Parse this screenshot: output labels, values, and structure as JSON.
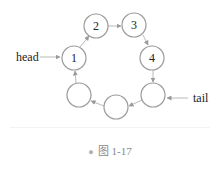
{
  "diagram": {
    "type": "circular-linked-list",
    "nodes": [
      {
        "id": "n1",
        "label": "1",
        "cx": 74,
        "cy": 58
      },
      {
        "id": "n2",
        "label": "2",
        "cx": 96,
        "cy": 26
      },
      {
        "id": "n3",
        "label": "3",
        "cx": 134,
        "cy": 25
      },
      {
        "id": "n4",
        "label": "4",
        "cx": 152,
        "cy": 58
      },
      {
        "id": "n5",
        "label": "",
        "cx": 153,
        "cy": 95
      },
      {
        "id": "n6",
        "label": "",
        "cx": 116,
        "cy": 107
      },
      {
        "id": "n7",
        "label": "",
        "cx": 79,
        "cy": 95
      }
    ],
    "edges": [
      {
        "from": "n1",
        "to": "n2"
      },
      {
        "from": "n2",
        "to": "n3"
      },
      {
        "from": "n3",
        "to": "n4"
      },
      {
        "from": "n4",
        "to": "n5"
      },
      {
        "from": "n5",
        "to": "n6"
      },
      {
        "from": "n6",
        "to": "n7"
      },
      {
        "from": "n7",
        "to": "n1"
      }
    ],
    "pointers": {
      "head": {
        "label": "head",
        "target": "n1"
      },
      "tail": {
        "label": "tail",
        "target": "n5"
      }
    },
    "colors": {
      "node_stroke": "#9a9a9a",
      "edge": "#a8a8a8",
      "text": "#222222",
      "caption": "#8a8a8a"
    }
  },
  "caption": {
    "bullet": "●",
    "text": "图 1-17"
  }
}
